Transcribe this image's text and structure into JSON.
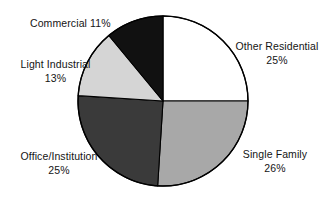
{
  "chart_data": {
    "type": "pie",
    "title": "",
    "subtitle": "",
    "xlabel": "",
    "ylabel": "",
    "legend_position": "none",
    "grid": false,
    "units": "percent",
    "start_angle_deg": 0,
    "direction": "clockwise",
    "center": {
      "x": 163,
      "y": 101
    },
    "radius": 85,
    "categories": [
      "Other Residential",
      "Single Family",
      "Office/Institution",
      "Light Industrial",
      "Commercial"
    ],
    "values": [
      25,
      26,
      25,
      13,
      11
    ],
    "value_labels": [
      "25%",
      "26%",
      "25%",
      "13%",
      "11%"
    ],
    "slices": [
      {
        "label": "Other Residential",
        "value": 25,
        "value_label": "25%",
        "color": "#ffffff",
        "start_deg": 0,
        "end_deg": 90
      },
      {
        "label": "Single Family",
        "value": 26,
        "value_label": "26%",
        "color": "#a8a8a8",
        "start_deg": 90,
        "end_deg": 183.6
      },
      {
        "label": "Office/Institution",
        "value": 25,
        "value_label": "25%",
        "color": "#3a3a3a",
        "start_deg": 183.6,
        "end_deg": 273.6
      },
      {
        "label": "Light Industrial",
        "value": 13,
        "value_label": "13%",
        "color": "#d5d5d5",
        "start_deg": 273.6,
        "end_deg": 320.4
      },
      {
        "label": "Commercial",
        "value": 11,
        "value_label": "11%",
        "color": "#111111",
        "start_deg": 320.4,
        "end_deg": 360
      }
    ],
    "stroke_color": "#000000",
    "background": "#ffffff"
  },
  "labels": {
    "commercial": {
      "name": "Commercial",
      "value": "11%"
    },
    "light_industrial": {
      "name": "Light Industrial",
      "value": "13%"
    },
    "office_institution": {
      "name": "Office/Institution",
      "value": "25%"
    },
    "other_residential": {
      "name": "Other Residential",
      "value": "25%"
    },
    "single_family": {
      "name": "Single Family",
      "value": "26%"
    }
  }
}
